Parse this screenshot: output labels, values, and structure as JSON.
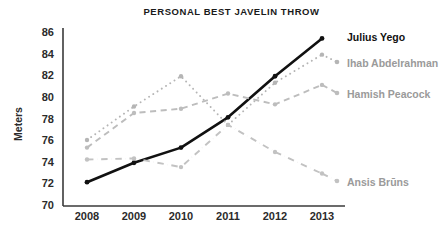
{
  "chart_data": {
    "type": "line",
    "title": "PERSONAL BEST JAVELIN THROW",
    "xlabel": "",
    "ylabel": "Meters",
    "categories": [
      "2008",
      "2009",
      "2010",
      "2011",
      "2012",
      "2013"
    ],
    "x": [
      2008,
      2009,
      2010,
      2011,
      2012,
      2013
    ],
    "ylim": [
      70,
      86
    ],
    "yticks": [
      70,
      72,
      74,
      76,
      78,
      80,
      82,
      84,
      86
    ],
    "grid": false,
    "legend_position": "right-inline-labels",
    "series": [
      {
        "name": "Julius Yego",
        "values": [
          72.2,
          74.0,
          75.4,
          78.2,
          82.0,
          85.5
        ],
        "color": "#111111",
        "style": "solid",
        "emphasis": true,
        "label_x": 345,
        "label_y": 31
      },
      {
        "name": "Ihab Abdelrahman",
        "values": [
          76.1,
          79.2,
          82.0,
          77.5,
          81.4,
          84.0
        ],
        "color": "#b5b5b5",
        "style": "dotted",
        "emphasis": false,
        "label_x": 345,
        "label_y": 57
      },
      {
        "name": "Hamish Peacock",
        "values": [
          75.4,
          78.6,
          79.0,
          80.4,
          79.4,
          81.2
        ],
        "color": "#bdbdbd",
        "style": "dashed",
        "emphasis": false,
        "label_x": 345,
        "label_y": 88
      },
      {
        "name": "Ansis Brūns",
        "values": [
          74.3,
          74.4,
          73.6,
          77.5,
          75.0,
          73.0
        ],
        "color": "#c2c2c2",
        "style": "dashdot",
        "emphasis": false,
        "label_x": 345,
        "label_y": 176
      }
    ]
  },
  "axes": {
    "y_tick_labels": [
      "86",
      "84",
      "82",
      "80",
      "78",
      "76",
      "74",
      "72",
      "70"
    ],
    "x_tick_labels": [
      "2008",
      "2009",
      "2010",
      "2011",
      "2012",
      "2013"
    ],
    "y_title": "Meters"
  }
}
